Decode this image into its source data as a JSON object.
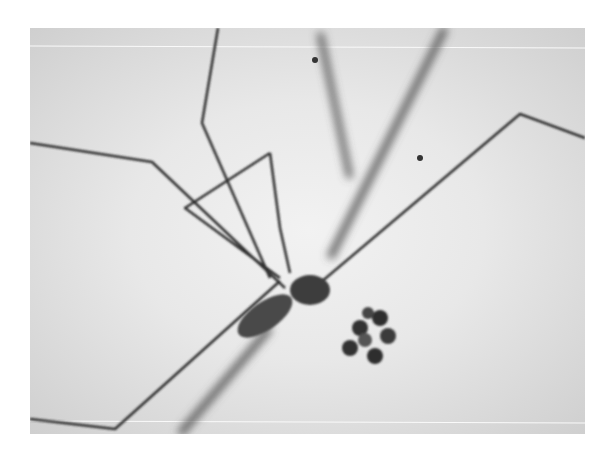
{
  "image": {
    "subject": "Grayscale microscope-style photograph of a long-legged spider (cellar spider) carrying an egg cluster",
    "style": "black and white",
    "colors": {
      "background": "#ffffff",
      "photo_light": "#ececec",
      "photo_dark": "#2a2a2a"
    }
  }
}
